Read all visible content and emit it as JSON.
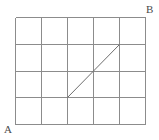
{
  "figure": {
    "type": "geometric-grid-diagram",
    "width": 159,
    "height": 140,
    "background_color": "#ffffff"
  },
  "grid": {
    "columns": 5,
    "rows": 4,
    "line_color": "#8c8c8c",
    "line_width": 1,
    "x_positions": [
      15,
      41,
      67,
      93,
      119,
      145
    ],
    "y_positions": [
      17,
      44,
      71,
      97,
      124
    ],
    "cell_width": 26,
    "cell_height": 26.75,
    "bounds": {
      "left": 15,
      "top": 17,
      "right": 145,
      "bottom": 124
    }
  },
  "diagonal": {
    "name": "diagonal-segment",
    "color": "#6e6e6e",
    "line_width": 1,
    "start": {
      "x": 67,
      "y": 97,
      "grid_col": 2,
      "grid_row": 3
    },
    "end": {
      "x": 119,
      "y": 44,
      "grid_col": 4,
      "grid_row": 1
    },
    "spans_columns": 2,
    "spans_rows": 2
  },
  "labels": {
    "a": {
      "text": "A",
      "position": "bottom-left",
      "x": 4,
      "y": 124
    },
    "b": {
      "text": "B",
      "position": "top-right",
      "x": 146,
      "y": 4
    }
  },
  "colors": {
    "grid_line": "#8c8c8c",
    "diagonal_line": "#6e6e6e",
    "label_text": "#4a4a4a",
    "background": "#ffffff"
  }
}
